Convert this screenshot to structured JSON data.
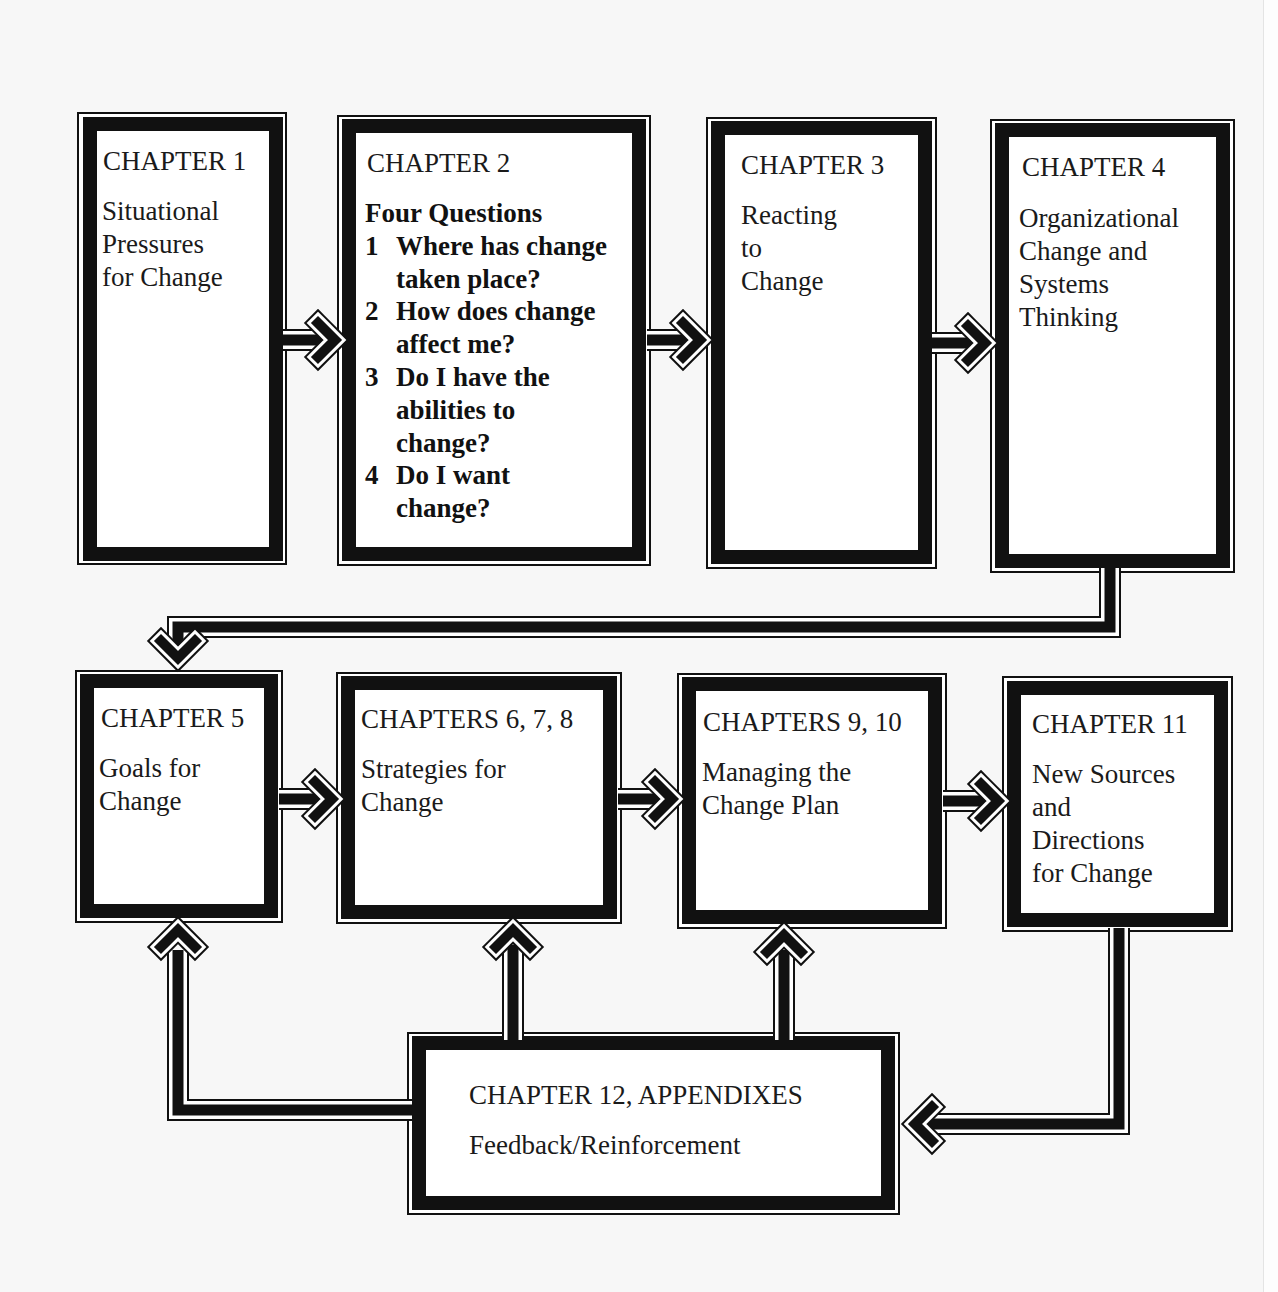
{
  "diagram": {
    "title_hidden": "",
    "boxes": [
      {
        "id": "ch1",
        "heading": "CHAPTER 1",
        "text": "Situational\nPressures\nfor Change"
      },
      {
        "id": "ch2",
        "heading": "CHAPTER 2",
        "subheading": "Four Questions",
        "questions": [
          {
            "num": "1",
            "text": "Where has change\ntaken place?"
          },
          {
            "num": "2",
            "text": "How does change\naffect me?"
          },
          {
            "num": "3",
            "text": "Do I have the\nabilities to\nchange?"
          },
          {
            "num": "4",
            "text": "Do I want\nchange?"
          }
        ]
      },
      {
        "id": "ch3",
        "heading": "CHAPTER 3",
        "text": "Reacting\nto\nChange"
      },
      {
        "id": "ch4",
        "heading": "CHAPTER 4",
        "text": "Organizational\nChange and\nSystems\nThinking"
      },
      {
        "id": "ch5",
        "heading": "CHAPTER 5",
        "text": "Goals for\nChange"
      },
      {
        "id": "ch678",
        "heading": "CHAPTERS 6, 7, 8",
        "text": "Strategies for\nChange"
      },
      {
        "id": "ch910",
        "heading": "CHAPTERS 9, 10",
        "text": "Managing the\nChange Plan"
      },
      {
        "id": "ch11",
        "heading": "CHAPTER 11",
        "text": "New Sources\nand\nDirections\nfor Change"
      },
      {
        "id": "ch12",
        "heading": "CHAPTER 12, APPENDIXES",
        "text": "Feedback/Reinforcement"
      }
    ],
    "connections": [
      {
        "from": "ch1",
        "to": "ch2",
        "direction": "right"
      },
      {
        "from": "ch2",
        "to": "ch3",
        "direction": "right"
      },
      {
        "from": "ch3",
        "to": "ch4",
        "direction": "right"
      },
      {
        "from": "ch4",
        "to": "ch5",
        "direction": "down"
      },
      {
        "from": "ch5",
        "to": "ch678",
        "direction": "right"
      },
      {
        "from": "ch678",
        "to": "ch910",
        "direction": "right"
      },
      {
        "from": "ch910",
        "to": "ch11",
        "direction": "right"
      },
      {
        "from": "ch11",
        "to": "ch12",
        "direction": "left"
      },
      {
        "from": "ch12",
        "to": "ch5",
        "direction": "up"
      },
      {
        "from": "ch12",
        "to": "ch678",
        "direction": "up"
      },
      {
        "from": "ch12",
        "to": "ch910",
        "direction": "up"
      }
    ],
    "colors": {
      "ink": "#111111",
      "paper": "#ffffff",
      "background": "#f7f7f7"
    }
  }
}
